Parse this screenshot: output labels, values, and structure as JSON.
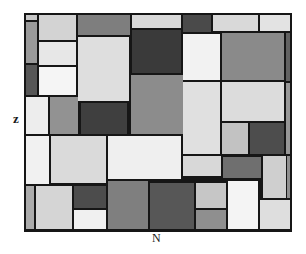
{
  "figure": {
    "y_axis_label": "z",
    "x_axis_label": "N",
    "background_color": "#ffffff",
    "line_color": "#161616",
    "style": "mondrian-like rectangle mosaic, grayscale"
  },
  "grid": {
    "x": 24,
    "y": 13,
    "width": 268,
    "height": 219,
    "rects": [
      {
        "x": 2,
        "y": 2,
        "w": 11,
        "h": 5,
        "c": "#c8c8c8"
      },
      {
        "x": 2,
        "y": 9,
        "w": 11,
        "h": 41,
        "c": "#9a9a9a"
      },
      {
        "x": 2,
        "y": 52,
        "w": 11,
        "h": 30,
        "c": "#575757"
      },
      {
        "x": 15,
        "y": 2,
        "w": 37,
        "h": 25,
        "c": "#d3d3d3"
      },
      {
        "x": 15,
        "y": 29,
        "w": 37,
        "h": 23,
        "c": "#e7e7e7"
      },
      {
        "x": 15,
        "y": 54,
        "w": 37,
        "h": 28,
        "c": "#f5f5f5"
      },
      {
        "x": 2,
        "y": 84,
        "w": 22,
        "h": 37,
        "c": "#ededed"
      },
      {
        "x": 26,
        "y": 84,
        "w": 28,
        "h": 37,
        "c": "#929292"
      },
      {
        "x": 54,
        "y": 2,
        "w": 52,
        "h": 20,
        "c": "#7e7e7e"
      },
      {
        "x": 54,
        "y": 24,
        "w": 51,
        "h": 64,
        "c": "#dedede"
      },
      {
        "x": 57,
        "y": 90,
        "w": 46,
        "h": 31,
        "c": "#3f3f3f"
      },
      {
        "x": 108,
        "y": 2,
        "w": 49,
        "h": 13,
        "c": "#d8d8d8"
      },
      {
        "x": 108,
        "y": 17,
        "w": 49,
        "h": 43,
        "c": "#3a3a3a"
      },
      {
        "x": 107,
        "y": 62,
        "w": 52,
        "h": 59,
        "c": "#8c8c8c"
      },
      {
        "x": 159,
        "y": 2,
        "w": 28,
        "h": 17,
        "c": "#4a4a4a"
      },
      {
        "x": 189,
        "y": 2,
        "w": 45,
        "h": 16,
        "c": "#d9d9d9"
      },
      {
        "x": 236,
        "y": 2,
        "w": 30,
        "h": 16,
        "c": "#e3e3e3"
      },
      {
        "x": 159,
        "y": 21,
        "w": 37,
        "h": 46,
        "c": "#f2f2f2"
      },
      {
        "x": 198,
        "y": 20,
        "w": 62,
        "h": 47,
        "c": "#8a8a8a"
      },
      {
        "x": 262,
        "y": 20,
        "w": 4,
        "h": 48,
        "c": "#626262"
      },
      {
        "x": 159,
        "y": 69,
        "w": 37,
        "h": 72,
        "c": "#e0e0e0"
      },
      {
        "x": 198,
        "y": 69,
        "w": 62,
        "h": 39,
        "c": "#dcdcdc"
      },
      {
        "x": 262,
        "y": 70,
        "w": 4,
        "h": 71,
        "c": "#979797"
      },
      {
        "x": 198,
        "y": 110,
        "w": 26,
        "h": 31,
        "c": "#c2c2c2"
      },
      {
        "x": 226,
        "y": 110,
        "w": 34,
        "h": 31,
        "c": "#4d4d4d"
      },
      {
        "x": 2,
        "y": 123,
        "w": 23,
        "h": 48,
        "c": "#f1f1f1"
      },
      {
        "x": 27,
        "y": 123,
        "w": 55,
        "h": 47,
        "c": "#dadada"
      },
      {
        "x": 84,
        "y": 123,
        "w": 73,
        "h": 43,
        "c": "#efefef"
      },
      {
        "x": 2,
        "y": 173,
        "w": 8,
        "h": 43,
        "c": "#ababab"
      },
      {
        "x": 12,
        "y": 173,
        "w": 36,
        "h": 43,
        "c": "#d5d5d5"
      },
      {
        "x": 50,
        "y": 173,
        "w": 32,
        "h": 22,
        "c": "#4c4c4c"
      },
      {
        "x": 50,
        "y": 197,
        "w": 32,
        "h": 19,
        "c": "#f0f0f0"
      },
      {
        "x": 84,
        "y": 168,
        "w": 40,
        "h": 48,
        "c": "#7f7f7f"
      },
      {
        "x": 126,
        "y": 170,
        "w": 44,
        "h": 46,
        "c": "#575757"
      },
      {
        "x": 159,
        "y": 143,
        "w": 38,
        "h": 20,
        "c": "#d8d8d8"
      },
      {
        "x": 199,
        "y": 144,
        "w": 38,
        "h": 21,
        "c": "#6f6f6f"
      },
      {
        "x": 239,
        "y": 143,
        "w": 23,
        "h": 42,
        "c": "#cfcfcf"
      },
      {
        "x": 263,
        "y": 143,
        "w": 3,
        "h": 42,
        "c": "#8f8f8f"
      },
      {
        "x": 172,
        "y": 170,
        "w": 30,
        "h": 25,
        "c": "#c6c6c6"
      },
      {
        "x": 172,
        "y": 197,
        "w": 30,
        "h": 19,
        "c": "#8f8f8f"
      },
      {
        "x": 204,
        "y": 168,
        "w": 30,
        "h": 48,
        "c": "#f4f4f4"
      },
      {
        "x": 236,
        "y": 187,
        "w": 30,
        "h": 29,
        "c": "#dedede"
      }
    ]
  }
}
